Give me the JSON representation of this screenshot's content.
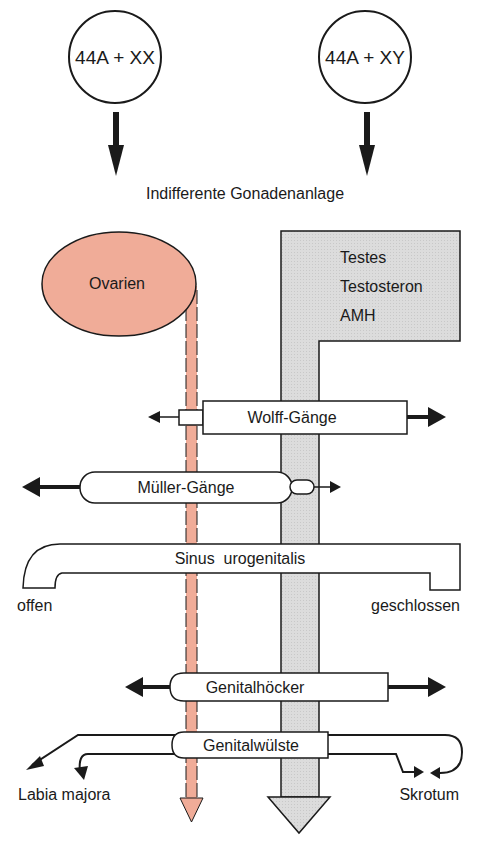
{
  "diagram": {
    "genotypes": {
      "female": "44A + XX",
      "male": "44A + XY"
    },
    "indifferent_stage": "Indifferente Gonadenanlage",
    "female_gonad": "Ovarien",
    "male_block": {
      "line1": "Testes",
      "line2": "Testosteron",
      "line3": "AMH"
    },
    "structures": {
      "wolff": "Wolff-Gänge",
      "mueller": "Müller-Gänge",
      "sinus": "Sinus  urogenitalis",
      "sinus_left": "offen",
      "sinus_right": "geschlossen",
      "genitalhoecker": "Genitalhöcker",
      "genitalwuelste": "Genitalwülste",
      "labia": "Labia majora",
      "skrotum": "Skrotum"
    },
    "colors": {
      "female": "#f0ac98",
      "male": "#dcdcdc",
      "stroke": "#1a1a1a"
    }
  }
}
